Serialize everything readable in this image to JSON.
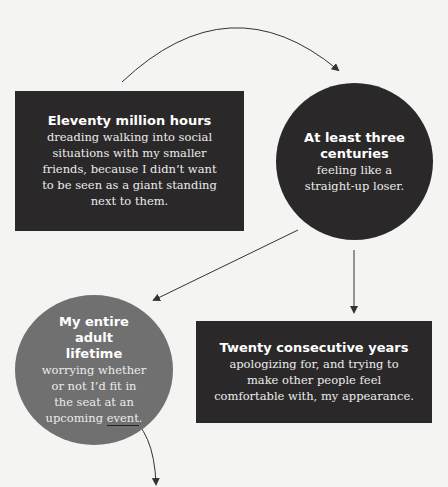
{
  "colors": {
    "background": "#f4f4f2",
    "dark": "#2a2828",
    "mid_gray": "#707070",
    "arrow": "#333333"
  },
  "nodes": [
    {
      "shape": "rectangle",
      "title": "Eleventy million hours",
      "body": "dreading walking into social situations with my smaller friends, because I didn’t want to be seen as a giant standing next to them."
    },
    {
      "shape": "circle",
      "title": "At least three centuries",
      "body": "feeling like a straight-up loser."
    },
    {
      "shape": "circle",
      "title": "My entire adult lifetime",
      "body_prefix": "worrying whether or not I’d fit in the seat at an upcoming ",
      "body_underlined": "event",
      "body_suffix": "."
    },
    {
      "shape": "rectangle",
      "title": "Twenty consecutive years",
      "body": "apologizing for, and trying to make other people feel comfortable with, my appearance."
    }
  ],
  "arrows": [
    {
      "from": "Eleventy million hours",
      "to": "At least three centuries",
      "style": "arc"
    },
    {
      "from": "At least three centuries",
      "to": "My entire adult lifetime",
      "style": "straight"
    },
    {
      "from": "At least three centuries",
      "to": "Twenty consecutive years",
      "style": "straight"
    },
    {
      "from": "My entire adult lifetime",
      "to": "continues below",
      "style": "curve"
    }
  ]
}
